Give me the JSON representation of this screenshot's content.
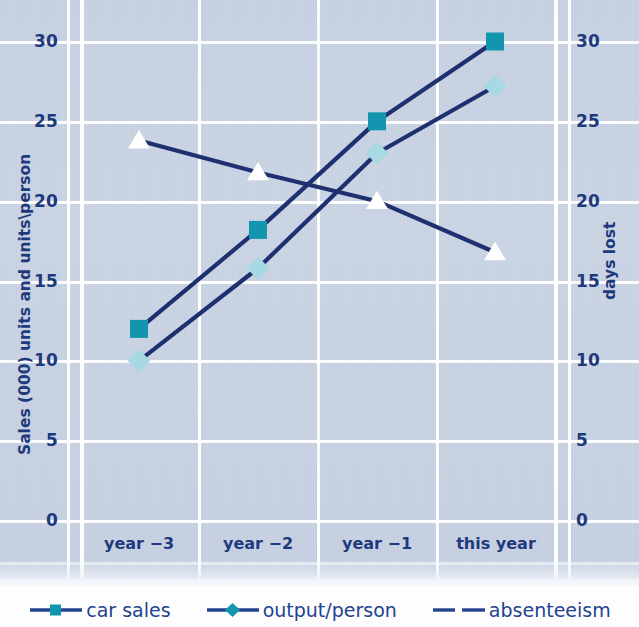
{
  "chart_data": {
    "type": "line",
    "title": "",
    "categories": [
      "year −3",
      "year −2",
      "year −1",
      "this year"
    ],
    "series": [
      {
        "name": "car sales",
        "values": [
          12,
          18.2,
          25,
          30
        ],
        "axis": "left",
        "marker": "square",
        "marker_color": "#1395b0",
        "line_color": "#1e3070"
      },
      {
        "name": "output/person",
        "values": [
          10,
          15.8,
          23,
          27.2
        ],
        "axis": "left",
        "marker": "diamond",
        "marker_color": "#a6d9e3",
        "line_color": "#1e3070"
      },
      {
        "name": "absenteeism",
        "values": [
          23.8,
          21.8,
          20,
          16.8
        ],
        "axis": "right",
        "marker": "triangle",
        "marker_color": "#ffffff",
        "line_color": "#1e3070"
      }
    ],
    "ylabel": "Sales (000) units and units\\person",
    "ylabel_right": "days lost",
    "xlabel": "",
    "ylim": [
      0,
      30
    ],
    "ylim_right": [
      0,
      30
    ],
    "yticks": [
      0,
      5,
      10,
      15,
      20,
      25,
      30
    ],
    "yticks_right": [
      0,
      5,
      10,
      15,
      20,
      25,
      30
    ],
    "ytick_labels": [
      "0",
      "5",
      "10",
      "15",
      "20",
      "25",
      "30"
    ],
    "ytick_labels_right": [
      "0",
      "5",
      "10",
      "15",
      "20",
      "25",
      "30"
    ],
    "grid": true,
    "legend_position": "bottom"
  },
  "axes": {
    "left_title": "Sales (000) units and units\\person",
    "right_title": "days lost",
    "left_ticks": [
      "30",
      "25",
      "20",
      "15",
      "10",
      "5",
      "0"
    ],
    "right_ticks": [
      "30",
      "25",
      "20",
      "15",
      "10",
      "5",
      "0"
    ],
    "categories": [
      "year −3",
      "year −2",
      "year −1",
      "this year"
    ]
  },
  "legend": {
    "items": [
      {
        "label": "car sales",
        "marker": "square-marker",
        "marker_color": "#1395b0",
        "line_color": "#23438f"
      },
      {
        "label": "output/person",
        "marker": "diamond-marker",
        "marker_color": "#1395b0",
        "line_color": "#23438f"
      },
      {
        "label": "absenteeism",
        "marker": "dashed-line",
        "marker_color": "#23438f",
        "line_color": "#23438f"
      }
    ]
  },
  "colors": {
    "background": "#c5cfe1",
    "grid": "#ffffff",
    "text": "#1d3a7c",
    "line": "#1e3070",
    "marker_square": "#1395b0",
    "marker_diamond": "#a6d9e3",
    "marker_triangle": "#ffffff"
  }
}
